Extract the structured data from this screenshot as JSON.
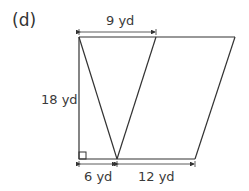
{
  "figure": {
    "part_label": "(d)",
    "shape": "trapezoid divided into triangles",
    "dimensions": {
      "top_segment": "9 yd",
      "height": "18 yd",
      "bottom_left": "6 yd",
      "bottom_right": "12 yd"
    },
    "right_angle_marker": true,
    "colors": {
      "stroke": "#333333",
      "background": "#ffffff"
    }
  }
}
